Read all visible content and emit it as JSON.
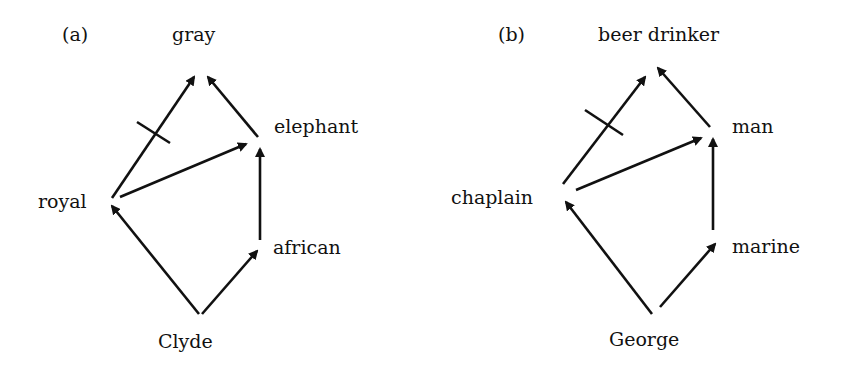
{
  "colors": {
    "ink": "#111111",
    "background": "#ffffff"
  },
  "panels": [
    {
      "tag": "(a)",
      "nodes": {
        "top": "gray",
        "upper_right": "elephant",
        "left": "royal",
        "lower_right": "african",
        "bottom": "Clyde"
      },
      "edges": [
        {
          "from": "royal",
          "to": "gray",
          "negated": true
        },
        {
          "from": "elephant",
          "to": "gray",
          "negated": false
        },
        {
          "from": "royal",
          "to": "elephant",
          "negated": false
        },
        {
          "from": "african",
          "to": "elephant",
          "negated": false
        },
        {
          "from": "Clyde",
          "to": "royal",
          "negated": false
        },
        {
          "from": "Clyde",
          "to": "african",
          "negated": false
        }
      ]
    },
    {
      "tag": "(b)",
      "nodes": {
        "top": "beer drinker",
        "upper_right": "man",
        "left": "chaplain",
        "lower_right": "marine",
        "bottom": "George"
      },
      "edges": [
        {
          "from": "chaplain",
          "to": "beer drinker",
          "negated": true
        },
        {
          "from": "man",
          "to": "beer drinker",
          "negated": false
        },
        {
          "from": "chaplain",
          "to": "man",
          "negated": false
        },
        {
          "from": "marine",
          "to": "man",
          "negated": false
        },
        {
          "from": "George",
          "to": "chaplain",
          "negated": false
        },
        {
          "from": "George",
          "to": "marine",
          "negated": false
        }
      ]
    }
  ]
}
